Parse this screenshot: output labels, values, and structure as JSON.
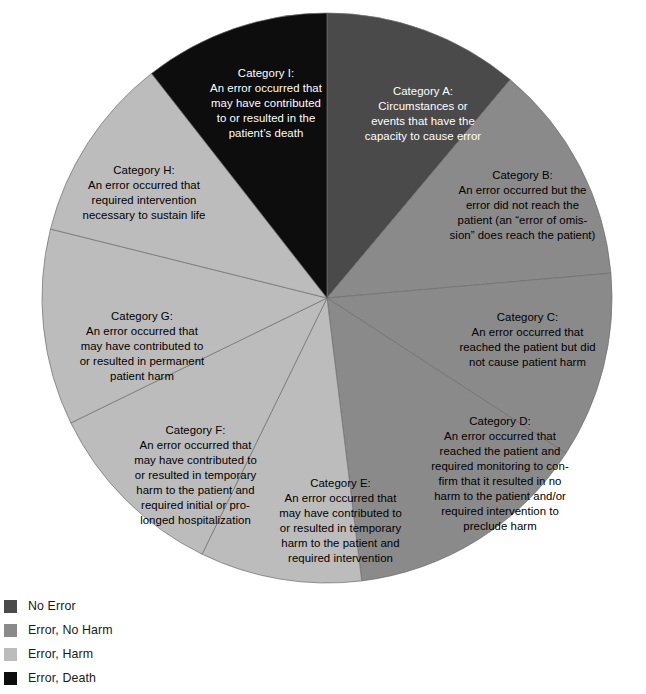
{
  "chart_data": {
    "type": "pie",
    "title": "",
    "subtitle": "",
    "xlabel": "",
    "ylabel": "",
    "grid": false,
    "legend_position": "bottom-left",
    "start_angle_deg": 0,
    "direction": "clockwise",
    "center": {
      "x": 327,
      "y": 298
    },
    "radius": 285,
    "categories": [
      "Category A",
      "Category B",
      "Category C",
      "Category D",
      "Category E",
      "Category F",
      "Category G",
      "Category H",
      "Category I"
    ],
    "values": [
      40,
      45,
      38,
      50,
      33,
      38,
      40,
      38,
      38
    ],
    "slice_fractions_deg": [
      40,
      45,
      38,
      50,
      33,
      38,
      40,
      38,
      38
    ],
    "series": [
      {
        "name": "NCC MERP Index for Categorizing Medication Errors",
        "values": [
          40,
          45,
          38,
          50,
          33,
          38,
          40,
          38,
          38
        ]
      }
    ],
    "slices": [
      {
        "id": "A",
        "label": "Category A:",
        "text": "Circumstances or events that have the capacity to cause error",
        "group": "No Error",
        "color": "#4a4a4a",
        "text_color": "#ffffff",
        "start_deg": 0,
        "end_deg": 40
      },
      {
        "id": "B",
        "label": "Category B:",
        "text": "An error occurred but the error did not reach the patient (an \"error of omis-sion\" does reach the patient)",
        "group": "Error, No Harm",
        "color": "#8a8a8a",
        "text_color": "#000000",
        "start_deg": 40,
        "end_deg": 85
      },
      {
        "id": "C",
        "label": "Category C:",
        "text": "An error occurred that reached the patient but did not cause patient harm",
        "group": "Error, No Harm",
        "color": "#8a8a8a",
        "text_color": "#000000",
        "start_deg": 85,
        "end_deg": 123
      },
      {
        "id": "D",
        "label": "Category D:",
        "text": "An error occurred that reached the patient and required monitoring to con-firm that it resulted in no harm to the patient and/or required intervention to preclude harm",
        "group": "Error, No Harm",
        "color": "#8a8a8a",
        "text_color": "#000000",
        "start_deg": 123,
        "end_deg": 173
      },
      {
        "id": "E",
        "label": "Category E:",
        "text": "An error occurred that may have contributed to or resulted in temporary harm to the patient and required intervention",
        "group": "Error, Harm",
        "color": "#bcbcbc",
        "text_color": "#000000",
        "start_deg": 173,
        "end_deg": 206
      },
      {
        "id": "F",
        "label": "Category F:",
        "text": "An error occurred that may have contributed to or resulted in temporary harm to the patient and required initial or pro-longed hospitalization",
        "group": "Error, Harm",
        "color": "#bcbcbc",
        "text_color": "#000000",
        "start_deg": 206,
        "end_deg": 244
      },
      {
        "id": "G",
        "label": "Category G:",
        "text": "An error occurred that may have contributed to or resulted in permanent patient harm",
        "group": "Error, Harm",
        "color": "#bcbcbc",
        "text_color": "#000000",
        "start_deg": 244,
        "end_deg": 284
      },
      {
        "id": "H",
        "label": "Category H:",
        "text": "An error occurred that required intervention necessary to sustain life",
        "group": "Error, Harm",
        "color": "#bcbcbc",
        "text_color": "#000000",
        "start_deg": 284,
        "end_deg": 322
      },
      {
        "id": "I",
        "label": "Category I:",
        "text": "An error occurred that may have contributed to or resulted in the patient's death",
        "group": "Error, Death",
        "color": "#0d0d0d",
        "text_color": "#ffffff",
        "start_deg": 322,
        "end_deg": 360
      }
    ],
    "legend": [
      {
        "label": "No Error",
        "color": "#4a4a4a"
      },
      {
        "label": "Error, No Harm",
        "color": "#8a8a8a"
      },
      {
        "label": "Error, Harm",
        "color": "#bcbcbc"
      },
      {
        "label": "Error, Death",
        "color": "#0d0d0d"
      }
    ]
  },
  "labels": {
    "A": "Category A:\nCircumstances or\nevents that have the\ncapacity to cause error",
    "B": "Category B:\nAn error occurred but the\nerror did not reach the\npatient (an “error of omis-\nsion” does reach the patient)",
    "C": "Category C:\nAn error occurred that\nreached the patient but did\nnot cause patient harm",
    "D": "Category D:\nAn error occurred that\nreached the patient and\nrequired monitoring to con-\nfirm that it resulted in no\nharm to the patient and/or\nrequired intervention to\npreclude harm",
    "E": "Category E:\nAn error occurred that\nmay have contributed to\nor resulted in temporary\nharm to the patient and\nrequired intervention",
    "F": "Category F:\nAn error occurred that\nmay have contributed to\nor resulted in temporary\nharm to the patient and\nrequired initial or pro-\nlonged hospitalization",
    "G": "Category G:\nAn error occurred that\nmay have contributed to\nor resulted in permanent\npatient harm",
    "H": "Category H:\nAn error occurred that\nrequired intervention\nnecessary to sustain life",
    "I": "Category I:\nAn error occurred that\nmay have contributed\nto or resulted in the\npatient’s death"
  }
}
